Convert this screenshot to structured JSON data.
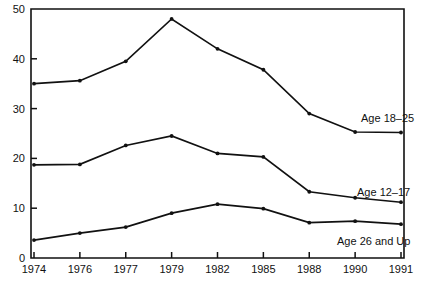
{
  "chart_data": {
    "type": "line",
    "title": "",
    "subtitle": "",
    "xlabel": "",
    "ylabel": "",
    "categories": [
      "1974",
      "1976",
      "1977",
      "1979",
      "1982",
      "1985",
      "1988",
      "1990",
      "1991"
    ],
    "ylim": [
      0,
      50
    ],
    "yticks": [
      0,
      10,
      20,
      30,
      40,
      50
    ],
    "ytick_labels": [
      "0",
      "10",
      "20",
      "30",
      "40",
      "50"
    ],
    "grid": false,
    "legend_position": "inline-right-of-line-ends",
    "series": [
      {
        "name": "Age 18–25",
        "values": [
          35.0,
          35.6,
          39.5,
          48.0,
          42.0,
          37.8,
          29.0,
          25.3,
          25.2
        ],
        "color": "#111111",
        "label_text": "Age 18–25"
      },
      {
        "name": "Age 12–17",
        "values": [
          18.7,
          18.8,
          22.6,
          24.5,
          21.0,
          20.3,
          13.3,
          12.1,
          11.2
        ],
        "color": "#111111",
        "label_text": "Age 12–17"
      },
      {
        "name": "Age 26 and Up",
        "values": [
          3.6,
          5.0,
          6.2,
          9.0,
          10.8,
          9.9,
          7.1,
          7.4,
          6.8
        ],
        "color": "#111111",
        "label_text": "Age 26 and Up"
      }
    ]
  },
  "axis": {
    "y_tick_labels": [
      "50",
      "40",
      "30",
      "20",
      "10",
      "0"
    ],
    "x_tick_labels": [
      "1974",
      "1976",
      "1977",
      "1979",
      "1982",
      "1985",
      "1988",
      "1990",
      "1991"
    ]
  },
  "labels": {
    "series_1": "Age 18–25",
    "series_2": "Age 12–17",
    "series_3": "Age 26 and Up"
  },
  "caption": {
    "text": ""
  },
  "colors": {
    "line": "#111111",
    "axis": "#111111",
    "background": "#ffffff",
    "text": "#111111"
  }
}
